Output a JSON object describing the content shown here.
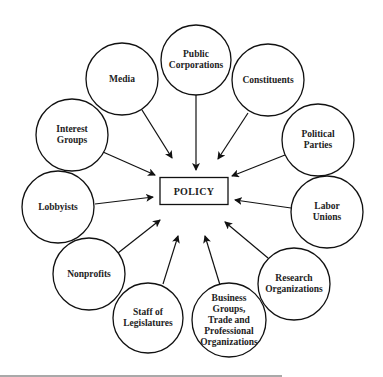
{
  "center": {
    "label": "POLICY",
    "x": 194,
    "y": 191,
    "w": 68,
    "h": 27
  },
  "nodes": [
    {
      "id": "public-corporations",
      "label": "Public\nCorporations",
      "cx": 196,
      "cy": 60,
      "r": 35,
      "arrow": [
        196,
        95,
        196,
        170
      ]
    },
    {
      "id": "media",
      "label": "Media",
      "cx": 122,
      "cy": 79,
      "r": 36,
      "arrow": [
        142,
        110,
        172,
        158
      ]
    },
    {
      "id": "constituents",
      "label": "Constituents",
      "cx": 268,
      "cy": 80,
      "r": 36,
      "arrow": [
        248,
        113,
        218,
        159
      ]
    },
    {
      "id": "interest-groups",
      "label": "Interest\nGroups",
      "cx": 72,
      "cy": 135,
      "r": 36,
      "arrow": [
        103,
        152,
        155,
        175
      ]
    },
    {
      "id": "political-parties",
      "label": "Political\nParties",
      "cx": 318,
      "cy": 140,
      "r": 36,
      "arrow": [
        285,
        155,
        232,
        176
      ]
    },
    {
      "id": "lobbyists",
      "label": "Lobbyists",
      "cx": 58,
      "cy": 207,
      "r": 36,
      "arrow": [
        95,
        204,
        153,
        197
      ]
    },
    {
      "id": "labor-unions",
      "label": "Labor\nUnions",
      "cx": 327,
      "cy": 212,
      "r": 36,
      "arrow": [
        291,
        208,
        235,
        200
      ]
    },
    {
      "id": "nonprofits",
      "label": "Nonprofits",
      "cx": 89,
      "cy": 274,
      "r": 36,
      "arrow": [
        118,
        253,
        160,
        220
      ]
    },
    {
      "id": "research-organizations",
      "label": "Research\nOrganizations",
      "cx": 294,
      "cy": 284,
      "r": 36,
      "arrow": [
        268,
        258,
        225,
        222
      ]
    },
    {
      "id": "staff-of-legislatures",
      "label": "Staff of\nLegislatures",
      "cx": 148,
      "cy": 318,
      "r": 35,
      "arrow": [
        163,
        284,
        178,
        236
      ]
    },
    {
      "id": "business-groups",
      "label": "Business\nGroups,\nTrade and\nProfessional\nOrganizations",
      "cx": 229,
      "cy": 320,
      "r": 37,
      "arrow": [
        220,
        285,
        205,
        236
      ]
    }
  ],
  "footer_rule": {
    "x1": 0,
    "x2": 282,
    "y": 376
  }
}
